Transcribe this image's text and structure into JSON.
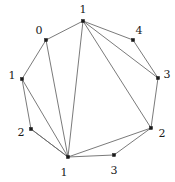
{
  "figure": {
    "name": "labeled-octagon-graph",
    "background_color": "#ffffff",
    "edge_color": "#6b6b6b",
    "vertex_color": "#1a1a1a",
    "label_color": "#1a1a1a",
    "width": 175,
    "height": 182
  },
  "chart_data": {
    "type": "diagram",
    "subtype": "node-link-graph",
    "title": "",
    "layout": "circular",
    "node_count": 8,
    "edge_count": 16,
    "nodes": [
      {
        "id": "n0",
        "label": "1",
        "x": 83,
        "y": 21,
        "label_x": 83,
        "label_y": 9,
        "position": "top"
      },
      {
        "id": "n1",
        "label": "4",
        "x": 133,
        "y": 40,
        "label_x": 139,
        "label_y": 30,
        "position": "top-right"
      },
      {
        "id": "n2",
        "label": "3",
        "x": 158,
        "y": 78,
        "label_x": 167,
        "label_y": 74,
        "position": "right-upper"
      },
      {
        "id": "n3",
        "label": "2",
        "x": 151,
        "y": 128,
        "label_x": 162,
        "label_y": 133,
        "position": "right-lower"
      },
      {
        "id": "n4",
        "label": "3",
        "x": 114,
        "y": 155,
        "label_x": 114,
        "label_y": 170,
        "position": "bottom-right"
      },
      {
        "id": "n5",
        "label": "1",
        "x": 68,
        "y": 157,
        "label_x": 64,
        "label_y": 172,
        "position": "bottom"
      },
      {
        "id": "n6",
        "label": "2",
        "x": 31,
        "y": 129,
        "label_x": 21,
        "label_y": 132,
        "position": "left-lower"
      },
      {
        "id": "n7",
        "label": "1",
        "x": 22,
        "y": 79,
        "label_x": 12,
        "label_y": 75,
        "position": "left-upper"
      },
      {
        "id": "n8",
        "label": "0",
        "x": 46,
        "y": 40,
        "label_x": 39,
        "label_y": 30,
        "position": "top-left"
      }
    ],
    "edges": [
      {
        "from": "n8",
        "to": "n0",
        "kind": "perimeter"
      },
      {
        "from": "n0",
        "to": "n1",
        "kind": "perimeter"
      },
      {
        "from": "n1",
        "to": "n2",
        "kind": "perimeter"
      },
      {
        "from": "n2",
        "to": "n3",
        "kind": "perimeter"
      },
      {
        "from": "n3",
        "to": "n4",
        "kind": "perimeter"
      },
      {
        "from": "n4",
        "to": "n5",
        "kind": "perimeter"
      },
      {
        "from": "n5",
        "to": "n6",
        "kind": "perimeter"
      },
      {
        "from": "n6",
        "to": "n7",
        "kind": "perimeter"
      },
      {
        "from": "n7",
        "to": "n8",
        "kind": "perimeter"
      },
      {
        "from": "n0",
        "to": "n2",
        "kind": "chord"
      },
      {
        "from": "n0",
        "to": "n3",
        "kind": "chord"
      },
      {
        "from": "n0",
        "to": "n5",
        "kind": "chord"
      },
      {
        "from": "n8",
        "to": "n5",
        "kind": "chord"
      },
      {
        "from": "n7",
        "to": "n5",
        "kind": "chord"
      },
      {
        "from": "n6",
        "to": "n5",
        "kind": "chord"
      },
      {
        "from": "n3",
        "to": "n5",
        "kind": "chord"
      }
    ],
    "note": "Vertices are dots labeled with integers; labels sit just outside the circular layout."
  }
}
